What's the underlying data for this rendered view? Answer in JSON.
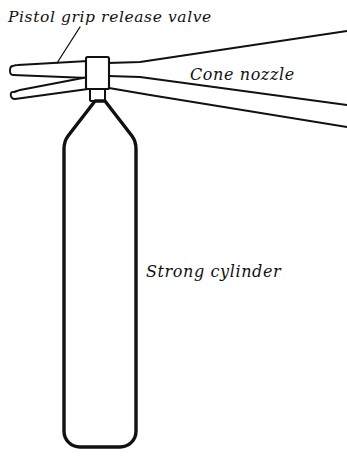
{
  "diagram": {
    "background_color": "#ffffff",
    "ink_color": "#111111",
    "labels": [
      {
        "id": "pistol-grip-release-valve",
        "text": "Pistol grip release valve",
        "x": 8,
        "y": 22,
        "has_leader_line": true
      },
      {
        "id": "cone-nozzle",
        "text": "Cone nozzle",
        "x": 190,
        "y": 80,
        "has_leader_line": false
      },
      {
        "id": "strong-cylinder",
        "text": "Strong cylinder",
        "x": 146,
        "y": 277,
        "has_leader_line": false
      }
    ],
    "parts": [
      {
        "id": "upper-handle",
        "name": "Upper trigger lever"
      },
      {
        "id": "lower-handle",
        "name": "Lower squeeze lever"
      },
      {
        "id": "valve-body",
        "name": "Valve body block"
      },
      {
        "id": "valve-neck",
        "name": "Valve neck collar"
      },
      {
        "id": "cone-nozzle-horn",
        "name": "Cone nozzle horn"
      },
      {
        "id": "cylinder-shoulder",
        "name": "Cylinder shoulder"
      },
      {
        "id": "cylinder-body",
        "name": "Strong cylinder body"
      }
    ]
  }
}
